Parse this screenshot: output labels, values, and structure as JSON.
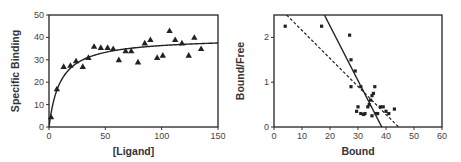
{
  "chart_data": [
    {
      "type": "scatter",
      "title": "",
      "xlabel": "[Ligand]",
      "ylabel": "Specific Binding",
      "xlim": [
        0,
        150
      ],
      "ylim": [
        0,
        50
      ],
      "xticks": [
        0,
        50,
        100,
        150
      ],
      "yticks": [
        0,
        10,
        20,
        30,
        40,
        50
      ],
      "grid": false,
      "legend": null,
      "marker": "triangle",
      "series": [
        {
          "name": "data",
          "x": [
            1.8,
            7,
            13,
            19,
            24,
            30,
            35,
            40,
            46,
            52,
            57,
            62,
            68,
            73,
            79,
            85,
            90,
            96,
            101,
            107,
            112,
            118,
            124,
            129,
            135
          ],
          "y": [
            4.5,
            17,
            27,
            27.5,
            29.5,
            27,
            31,
            36,
            35.5,
            35.5,
            35,
            30,
            34,
            34,
            29,
            37.5,
            39,
            31,
            32,
            43,
            39,
            37.5,
            32,
            40,
            35
          ]
        },
        {
          "name": "fit",
          "style": "solid-curve",
          "model": "hyperbola",
          "Bmax": 40,
          "Kd": 10
        }
      ]
    },
    {
      "type": "scatter",
      "title": "",
      "xlabel": "Bound",
      "ylabel": "Bound/Free",
      "xlim": [
        0,
        60
      ],
      "ylim": [
        0,
        2.5
      ],
      "xticks": [
        0,
        10,
        20,
        30,
        40,
        50,
        60
      ],
      "yticks": [
        0,
        1,
        2
      ],
      "grid": false,
      "legend": null,
      "marker": "square",
      "series": [
        {
          "name": "data",
          "x": [
            4,
            17,
            27,
            27.5,
            29,
            27.5,
            31,
            30,
            29.5,
            31,
            32,
            32.5,
            34,
            34.5,
            35,
            35.5,
            36,
            33.5,
            35,
            36.5,
            38,
            39,
            40,
            41,
            43,
            37
          ],
          "y": [
            2.25,
            2.25,
            2.05,
            1.5,
            1.25,
            0.9,
            0.9,
            0.45,
            0.35,
            0.3,
            0.28,
            0.3,
            0.5,
            0.6,
            0.7,
            0.75,
            0.9,
            0.45,
            0.25,
            0.3,
            0.45,
            0.45,
            0.35,
            0.3,
            0.4,
            0.3
          ]
        },
        {
          "name": "solid-line",
          "style": "solid",
          "x": [
            18,
            38.5
          ],
          "y": [
            2.5,
            0
          ]
        },
        {
          "name": "dashed-line",
          "style": "dashed",
          "x": [
            4.5,
            44.5
          ],
          "y": [
            2.5,
            0
          ]
        }
      ]
    }
  ]
}
